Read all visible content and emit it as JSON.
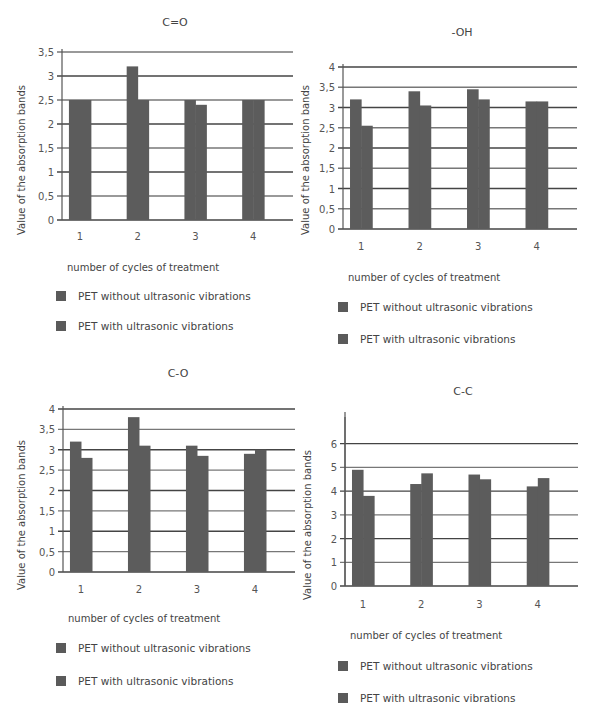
{
  "common": {
    "y_axis_label": "Value of the absorption bands",
    "x_axis_label": "number of cycles of treatment",
    "legend": [
      {
        "label": "PET without ultrasonic vibrations",
        "color": "#5a5a5a"
      },
      {
        "label": "PET with ultrasonic vibrations",
        "color": "#5a5a5a"
      }
    ]
  },
  "chart_data": [
    {
      "type": "bar",
      "title": "C=O",
      "xlabel": "number of cycles of treatment",
      "ylabel": "Value of the absorption bands",
      "categories": [
        "1",
        "2",
        "3",
        "4"
      ],
      "yticks": [
        "0",
        "0,5",
        "1",
        "1,5",
        "2",
        "2,5",
        "3",
        "3,5"
      ],
      "ylim": [
        0,
        3.5
      ],
      "grid": true,
      "legend_position": "bottom",
      "series": [
        {
          "name": "PET without ultrasonic vibrations",
          "values": [
            2.5,
            3.2,
            2.5,
            2.5
          ]
        },
        {
          "name": "PET with ultrasonic vibrations",
          "values": [
            2.5,
            2.5,
            2.4,
            2.5
          ]
        }
      ]
    },
    {
      "type": "bar",
      "title": "-OH",
      "xlabel": "number of cycles of treatment",
      "ylabel": "Value of the absorption bands",
      "categories": [
        "1",
        "2",
        "3",
        "4"
      ],
      "yticks": [
        "0",
        "0,5",
        "1",
        "1,5",
        "2",
        "2,5",
        "3",
        "3,5",
        "4"
      ],
      "ylim": [
        0,
        4
      ],
      "grid": true,
      "legend_position": "bottom",
      "series": [
        {
          "name": "PET without ultrasonic vibrations",
          "values": [
            3.2,
            3.4,
            3.45,
            3.15
          ]
        },
        {
          "name": "PET with ultrasonic vibrations",
          "values": [
            2.55,
            3.05,
            3.2,
            3.15
          ]
        }
      ]
    },
    {
      "type": "bar",
      "title": "C-O",
      "xlabel": "number of cycles of treatment",
      "ylabel": "Value of the absorption bands",
      "categories": [
        "1",
        "2",
        "3",
        "4"
      ],
      "yticks": [
        "0",
        "0,5",
        "1",
        "1,5",
        "2",
        "2,5",
        "3",
        "3,5",
        "4"
      ],
      "ylim": [
        0,
        4
      ],
      "grid": true,
      "legend_position": "bottom",
      "series": [
        {
          "name": "PET without ultrasonic vibrations",
          "values": [
            3.2,
            3.8,
            3.1,
            2.9
          ]
        },
        {
          "name": "PET with ultrasonic vibrations",
          "values": [
            2.8,
            3.1,
            2.85,
            3.0
          ]
        }
      ]
    },
    {
      "type": "bar",
      "title": "C-C",
      "xlabel": "number of cycles of treatment",
      "ylabel": "Value of the absorption bands",
      "categories": [
        "1",
        "2",
        "3",
        "4"
      ],
      "yticks": [
        "0",
        "1",
        "2",
        "3",
        "4",
        "5",
        "6"
      ],
      "ylim": [
        0,
        7
      ],
      "grid": true,
      "legend_position": "bottom",
      "series": [
        {
          "name": "PET without ultrasonic vibrations",
          "values": [
            4.9,
            4.3,
            4.7,
            4.2
          ]
        },
        {
          "name": "PET with ultrasonic vibrations",
          "values": [
            3.8,
            4.75,
            4.5,
            4.55
          ]
        }
      ]
    }
  ],
  "layout": [
    {
      "ax": 62,
      "top": 52,
      "bottom": 220,
      "right": 293,
      "ymax": 3.5,
      "tickStep": 0.5,
      "titleY": 16,
      "titleX": 175,
      "xlabY": 232,
      "xAxisTitleY": 262,
      "legY": [
        290,
        320
      ],
      "legX": 56,
      "ylabX": 16,
      "ylabY": 235
    },
    {
      "ax": 343,
      "top": 67,
      "bottom": 229,
      "right": 577,
      "ymax": 4,
      "tickStep": 0.5,
      "titleY": 26,
      "titleX": 462,
      "xlabY": 242,
      "xAxisTitleY": 272,
      "legY": [
        301,
        333
      ],
      "legX": 338,
      "ylabX": 300,
      "ylabY": 235
    },
    {
      "ax": 63,
      "top": 409,
      "bottom": 572,
      "right": 295,
      "ymax": 4,
      "tickStep": 0.5,
      "titleY": 367,
      "titleX": 178,
      "xlabY": 585,
      "xAxisTitleY": 613,
      "legY": [
        642,
        675
      ],
      "legX": 56,
      "ylabX": 16,
      "ylabY": 590
    },
    {
      "ax": 345,
      "top": 420,
      "bottom": 586,
      "right": 578,
      "ymax": 7,
      "tickStep": 1,
      "titleY": 385,
      "titleX": 463,
      "xlabY": 600,
      "xAxisTitleY": 630,
      "legY": [
        660,
        692
      ],
      "legX": 338,
      "ylabX": 302,
      "ylabY": 600
    }
  ]
}
